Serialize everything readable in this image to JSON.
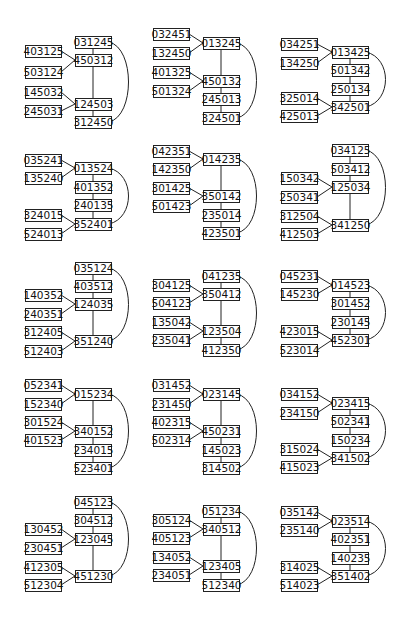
{
  "diagram": {
    "box": {
      "width": 36,
      "height": 12
    },
    "panels": [
      {
        "id": 1,
        "spine_x": 75,
        "leaf_x": 25,
        "spine": [
          {
            "label": "031245",
            "y": 36
          },
          {
            "label": "450312",
            "y": 54
          },
          {
            "label": "124503",
            "y": 98
          },
          {
            "label": "312450",
            "y": 116
          }
        ],
        "leaves": [
          {
            "label": "403125",
            "y": 45,
            "to": 1
          },
          {
            "label": "503124",
            "y": 66,
            "to": 1
          },
          {
            "label": "145032",
            "y": 86,
            "to": 2
          },
          {
            "label": "245031",
            "y": 105,
            "to": 2
          }
        ]
      },
      {
        "id": 2,
        "spine_x": 203,
        "leaf_x": 153,
        "spine": [
          {
            "label": "013245",
            "y": 37
          },
          {
            "label": "450132",
            "y": 75
          },
          {
            "label": "245013",
            "y": 93
          },
          {
            "label": "324501",
            "y": 112
          }
        ],
        "leaves": [
          {
            "label": "032451",
            "y": 28,
            "to": 0
          },
          {
            "label": "132450",
            "y": 47,
            "to": 0
          },
          {
            "label": "401325",
            "y": 66,
            "to": 1
          },
          {
            "label": "501324",
            "y": 85,
            "to": 1
          }
        ]
      },
      {
        "id": 3,
        "spine_x": 332,
        "leaf_x": 281,
        "spine": [
          {
            "label": "013425",
            "y": 46
          },
          {
            "label": "501342",
            "y": 64
          },
          {
            "label": "250134",
            "y": 83
          },
          {
            "label": "342501",
            "y": 101
          }
        ],
        "leaves": [
          {
            "label": "034251",
            "y": 38,
            "to": 0
          },
          {
            "label": "134250",
            "y": 57,
            "to": 0
          },
          {
            "label": "325014",
            "y": 92,
            "to": 3
          },
          {
            "label": "425013",
            "y": 110,
            "to": 3
          }
        ]
      },
      {
        "id": 4,
        "spine_x": 75,
        "leaf_x": 25,
        "spine": [
          {
            "label": "013524",
            "y": 162
          },
          {
            "label": "401352",
            "y": 181
          },
          {
            "label": "240135",
            "y": 199
          },
          {
            "label": "352401",
            "y": 218
          }
        ],
        "leaves": [
          {
            "label": "035241",
            "y": 154,
            "to": 0
          },
          {
            "label": "135240",
            "y": 172,
            "to": 0
          },
          {
            "label": "324015",
            "y": 209,
            "to": 3
          },
          {
            "label": "524013",
            "y": 228,
            "to": 3
          }
        ]
      },
      {
        "id": 5,
        "spine_x": 203,
        "leaf_x": 153,
        "spine": [
          {
            "label": "014235",
            "y": 153
          },
          {
            "label": "350142",
            "y": 190
          },
          {
            "label": "235014",
            "y": 209
          },
          {
            "label": "423501",
            "y": 227
          }
        ],
        "leaves": [
          {
            "label": "042351",
            "y": 145,
            "to": 0
          },
          {
            "label": "142350",
            "y": 163,
            "to": 0
          },
          {
            "label": "301425",
            "y": 182,
            "to": 1
          },
          {
            "label": "501423",
            "y": 200,
            "to": 1
          }
        ]
      },
      {
        "id": 6,
        "spine_x": 332,
        "leaf_x": 281,
        "spine": [
          {
            "label": "034125",
            "y": 144
          },
          {
            "label": "503412",
            "y": 163
          },
          {
            "label": "125034",
            "y": 181
          },
          {
            "label": "341250",
            "y": 219
          }
        ],
        "leaves": [
          {
            "label": "150342",
            "y": 172,
            "to": 2
          },
          {
            "label": "250341",
            "y": 191,
            "to": 2
          },
          {
            "label": "312504",
            "y": 210,
            "to": 3
          },
          {
            "label": "412503",
            "y": 228,
            "to": 3
          }
        ]
      },
      {
        "id": 7,
        "spine_x": 75,
        "leaf_x": 25,
        "spine": [
          {
            "label": "035124",
            "y": 262
          },
          {
            "label": "403512",
            "y": 280
          },
          {
            "label": "124035",
            "y": 298
          },
          {
            "label": "351240",
            "y": 335
          }
        ],
        "leaves": [
          {
            "label": "140352",
            "y": 289,
            "to": 2
          },
          {
            "label": "240351",
            "y": 308,
            "to": 2
          },
          {
            "label": "312405",
            "y": 326,
            "to": 3
          },
          {
            "label": "512403",
            "y": 345,
            "to": 3
          }
        ]
      },
      {
        "id": 8,
        "spine_x": 203,
        "leaf_x": 153,
        "spine": [
          {
            "label": "041235",
            "y": 270
          },
          {
            "label": "350412",
            "y": 288
          },
          {
            "label": "123504",
            "y": 325
          },
          {
            "label": "412350",
            "y": 344
          }
        ],
        "leaves": [
          {
            "label": "304125",
            "y": 279,
            "to": 1
          },
          {
            "label": "504123",
            "y": 297,
            "to": 1
          },
          {
            "label": "135042",
            "y": 316,
            "to": 2
          },
          {
            "label": "235041",
            "y": 334,
            "to": 2
          }
        ]
      },
      {
        "id": 9,
        "spine_x": 332,
        "leaf_x": 281,
        "spine": [
          {
            "label": "014523",
            "y": 279
          },
          {
            "label": "301452",
            "y": 297
          },
          {
            "label": "230145",
            "y": 316
          },
          {
            "label": "452301",
            "y": 334
          }
        ],
        "leaves": [
          {
            "label": "045231",
            "y": 270,
            "to": 0
          },
          {
            "label": "145230",
            "y": 288,
            "to": 0
          },
          {
            "label": "423015",
            "y": 325,
            "to": 3
          },
          {
            "label": "523014",
            "y": 344,
            "to": 3
          }
        ]
      },
      {
        "id": 10,
        "spine_x": 75,
        "leaf_x": 25,
        "spine": [
          {
            "label": "015234",
            "y": 388
          },
          {
            "label": "340152",
            "y": 425
          },
          {
            "label": "234015",
            "y": 444
          },
          {
            "label": "523401",
            "y": 462
          }
        ],
        "leaves": [
          {
            "label": "052341",
            "y": 379,
            "to": 0
          },
          {
            "label": "152340",
            "y": 398,
            "to": 0
          },
          {
            "label": "301524",
            "y": 416,
            "to": 1
          },
          {
            "label": "401523",
            "y": 434,
            "to": 1
          }
        ]
      },
      {
        "id": 11,
        "spine_x": 203,
        "leaf_x": 153,
        "spine": [
          {
            "label": "023145",
            "y": 388
          },
          {
            "label": "450231",
            "y": 425
          },
          {
            "label": "145023",
            "y": 444
          },
          {
            "label": "314502",
            "y": 462
          }
        ],
        "leaves": [
          {
            "label": "031452",
            "y": 379,
            "to": 0
          },
          {
            "label": "231450",
            "y": 398,
            "to": 0
          },
          {
            "label": "402315",
            "y": 416,
            "to": 1
          },
          {
            "label": "502314",
            "y": 434,
            "to": 1
          }
        ]
      },
      {
        "id": 12,
        "spine_x": 332,
        "leaf_x": 281,
        "spine": [
          {
            "label": "023415",
            "y": 397
          },
          {
            "label": "502341",
            "y": 415
          },
          {
            "label": "150234",
            "y": 434
          },
          {
            "label": "341502",
            "y": 452
          }
        ],
        "leaves": [
          {
            "label": "034152",
            "y": 388,
            "to": 0
          },
          {
            "label": "234150",
            "y": 407,
            "to": 0
          },
          {
            "label": "315024",
            "y": 443,
            "to": 3
          },
          {
            "label": "415023",
            "y": 461,
            "to": 3
          }
        ]
      },
      {
        "id": 13,
        "spine_x": 75,
        "leaf_x": 25,
        "spine": [
          {
            "label": "045123",
            "y": 496
          },
          {
            "label": "304512",
            "y": 514
          },
          {
            "label": "123045",
            "y": 533
          },
          {
            "label": "451230",
            "y": 570
          }
        ],
        "leaves": [
          {
            "label": "130452",
            "y": 523,
            "to": 2
          },
          {
            "label": "230451",
            "y": 542,
            "to": 2
          },
          {
            "label": "412305",
            "y": 561,
            "to": 3
          },
          {
            "label": "512304",
            "y": 579,
            "to": 3
          }
        ]
      },
      {
        "id": 14,
        "spine_x": 203,
        "leaf_x": 153,
        "spine": [
          {
            "label": "051234",
            "y": 505
          },
          {
            "label": "340512",
            "y": 523
          },
          {
            "label": "123405",
            "y": 560
          },
          {
            "label": "512340",
            "y": 579
          }
        ],
        "leaves": [
          {
            "label": "305124",
            "y": 514,
            "to": 1
          },
          {
            "label": "405123",
            "y": 532,
            "to": 1
          },
          {
            "label": "134052",
            "y": 551,
            "to": 2
          },
          {
            "label": "234051",
            "y": 569,
            "to": 2
          }
        ]
      },
      {
        "id": 15,
        "spine_x": 332,
        "leaf_x": 281,
        "spine": [
          {
            "label": "023514",
            "y": 515
          },
          {
            "label": "402351",
            "y": 533
          },
          {
            "label": "140235",
            "y": 552
          },
          {
            "label": "351402",
            "y": 570
          }
        ],
        "leaves": [
          {
            "label": "035142",
            "y": 506,
            "to": 0
          },
          {
            "label": "235140",
            "y": 524,
            "to": 0
          },
          {
            "label": "314025",
            "y": 561,
            "to": 3
          },
          {
            "label": "514023",
            "y": 579,
            "to": 3
          }
        ]
      }
    ]
  }
}
